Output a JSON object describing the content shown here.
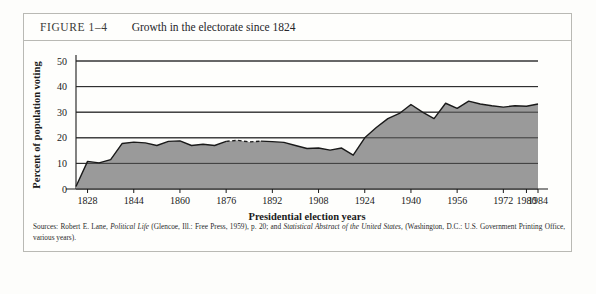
{
  "figure": {
    "number": "FIGURE 1–4",
    "title": "Growth in the electorate since 1824"
  },
  "sources": {
    "line1_a": "Sources: Robert E. Lane, ",
    "line1_italic1": "Political Life",
    "line1_b": " (Glencoe, Ill.: Free Press, 1959), p. 20; and ",
    "line1_italic2": "Statistical Abstract of the United States,",
    "line1_c": " (Washington, D.C.: U.S. Government Printing Office, various years)."
  },
  "chart_data": {
    "type": "area",
    "title": "Growth in the electorate since 1824",
    "xlabel": "Presidential election years",
    "ylabel": "Percent of population voting",
    "xlim": [
      1824,
      1984
    ],
    "ylim": [
      0,
      50
    ],
    "yticks": [
      0,
      10,
      20,
      30,
      40,
      50
    ],
    "xticks": [
      1828,
      1844,
      1860,
      1876,
      1892,
      1908,
      1924,
      1940,
      1956,
      1972,
      1980,
      1984
    ],
    "grid": true,
    "legend": "none",
    "fill_color": "#9a9a9a",
    "line_color": "#1a1a1a",
    "x": [
      1824,
      1828,
      1832,
      1836,
      1840,
      1844,
      1848,
      1852,
      1856,
      1860,
      1864,
      1868,
      1872,
      1876,
      1880,
      1884,
      1888,
      1892,
      1896,
      1900,
      1904,
      1908,
      1912,
      1916,
      1920,
      1924,
      1928,
      1932,
      1936,
      1940,
      1944,
      1948,
      1952,
      1956,
      1960,
      1964,
      1968,
      1972,
      1976,
      1980,
      1984
    ],
    "values": [
      1.0,
      10.8,
      10.2,
      11.5,
      17.8,
      18.3,
      18.0,
      17.0,
      18.6,
      18.8,
      17.0,
      17.5,
      17.0,
      18.6,
      19.0,
      18.4,
      18.7,
      18.5,
      18.2,
      17.0,
      15.8,
      16.0,
      15.2,
      16.0,
      13.2,
      20.0,
      24.0,
      27.5,
      29.5,
      33.0,
      30.0,
      27.5,
      33.5,
      31.5,
      34.3,
      33.2,
      32.5,
      32.0,
      32.5,
      32.3,
      33.2
    ],
    "dashed_segment": {
      "from": 1876,
      "to": 1884,
      "note": "broken line segment"
    }
  }
}
